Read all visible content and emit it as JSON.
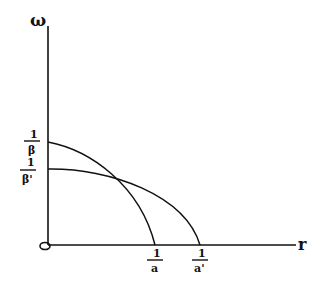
{
  "diagram": {
    "type": "sketch-graph",
    "y_axis_label": "ω",
    "x_axis_label": "r",
    "origin_label": "0",
    "y_ticks": [
      {
        "num": "1",
        "den": "β"
      },
      {
        "num": "1",
        "den": "β'"
      }
    ],
    "x_ticks": [
      {
        "num": "1",
        "den": "a"
      },
      {
        "num": "1",
        "den": "a'"
      }
    ],
    "curves": [
      {
        "name": "curve-beta-a",
        "y_intercept": "1/β",
        "x_intercept": "1/a"
      },
      {
        "name": "curve-betaprime-aprime",
        "y_intercept": "1/β'",
        "x_intercept": "1/a'"
      }
    ],
    "colors": {
      "ink": "#111111",
      "background": "#ffffff"
    }
  }
}
